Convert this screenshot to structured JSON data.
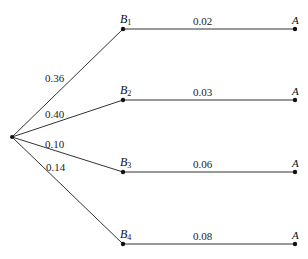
{
  "diagram": {
    "type": "probability-tree",
    "root": {
      "x": 12,
      "y": 137
    },
    "branches": [
      {
        "node": "B",
        "subscript": "1",
        "x": 123,
        "y": 29,
        "prob_B": "0.36",
        "prob_A_given_B": "0.02",
        "end_label": "A",
        "end_x": 295
      },
      {
        "node": "B",
        "subscript": "2",
        "x": 123,
        "y": 100,
        "prob_B": "0.40",
        "prob_A_given_B": "0.03",
        "end_label": "A",
        "end_x": 295
      },
      {
        "node": "B",
        "subscript": "3",
        "x": 123,
        "y": 172,
        "prob_B": "0.10",
        "prob_A_given_B": "0.06",
        "end_label": "A",
        "end_x": 295
      },
      {
        "node": "B",
        "subscript": "4",
        "x": 123,
        "y": 244,
        "prob_B": "0.14",
        "prob_A_given_B": "0.08",
        "end_label": "A",
        "end_x": 295
      }
    ]
  }
}
